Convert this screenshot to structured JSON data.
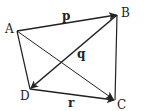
{
  "diagram": {
    "type": "vector-quadrilateral",
    "points": {
      "A": {
        "label": "A",
        "x": 17,
        "y": 31
      },
      "B": {
        "label": "B",
        "x": 117,
        "y": 15
      },
      "C": {
        "label": "C",
        "x": 115,
        "y": 100
      },
      "D": {
        "label": "D",
        "x": 30,
        "y": 89
      }
    },
    "vectors": [
      {
        "from": "A",
        "to": "B",
        "label": "p"
      },
      {
        "from": "B",
        "to": "D",
        "label": "q"
      },
      {
        "from": "D",
        "to": "C",
        "label": "r"
      }
    ],
    "segments": [
      {
        "from": "A",
        "to": "D"
      },
      {
        "from": "B",
        "to": "C"
      },
      {
        "from": "A",
        "to": "C"
      }
    ],
    "labels": {
      "A": "A",
      "B": "B",
      "C": "C",
      "D": "D",
      "p": "p",
      "q": "q",
      "r": "r"
    },
    "colors": {
      "stroke": "#222222",
      "background": "#ffffff"
    }
  }
}
